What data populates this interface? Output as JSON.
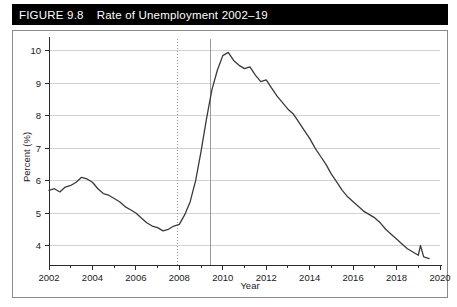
{
  "figure": {
    "number": "FIGURE 9.8",
    "title": "Rate of Unemployment 2002–19"
  },
  "chart_data": {
    "type": "line",
    "title": "Rate of Unemployment 2002–19",
    "xlabel": "Year",
    "ylabel": "Percent (%)",
    "xlim": [
      2002,
      2020
    ],
    "ylim": [
      3.4,
      10.3
    ],
    "grid": true,
    "legend": "none",
    "xticks": [
      2002,
      2004,
      2006,
      2008,
      2010,
      2012,
      2014,
      2016,
      2018,
      2020
    ],
    "xtick_labels": [
      "2002",
      "2004",
      "2006",
      "2008",
      "2010",
      "2012",
      "2014",
      "2016",
      "2018",
      "2020"
    ],
    "yticks": [
      4,
      5,
      6,
      7,
      8,
      9,
      10
    ],
    "ytick_labels": [
      "4",
      "5",
      "6",
      "7",
      "8",
      "9",
      "10"
    ],
    "annotations": [
      {
        "name": "recession-start-line",
        "type": "vline",
        "x": 2007.92,
        "style": "dotted",
        "color": "#9a9a9a"
      },
      {
        "name": "recession-end-line",
        "type": "vline",
        "x": 2009.42,
        "style": "solid",
        "color": "#9a9a9a"
      }
    ],
    "series": [
      {
        "name": "Unemployment rate",
        "color": "#3a3a3a",
        "x": [
          2002.0,
          2002.25,
          2002.5,
          2002.75,
          2003.0,
          2003.25,
          2003.5,
          2003.75,
          2004.0,
          2004.25,
          2004.5,
          2004.75,
          2005.0,
          2005.25,
          2005.5,
          2005.75,
          2006.0,
          2006.25,
          2006.5,
          2006.75,
          2007.0,
          2007.25,
          2007.5,
          2007.75,
          2008.0,
          2008.25,
          2008.5,
          2008.75,
          2009.0,
          2009.25,
          2009.5,
          2009.75,
          2010.0,
          2010.25,
          2010.5,
          2010.75,
          2011.0,
          2011.25,
          2011.5,
          2011.75,
          2012.0,
          2012.25,
          2012.5,
          2012.75,
          2013.0,
          2013.25,
          2013.5,
          2013.75,
          2014.0,
          2014.25,
          2014.5,
          2014.75,
          2015.0,
          2015.25,
          2015.5,
          2015.75,
          2016.0,
          2016.25,
          2016.5,
          2016.75,
          2017.0,
          2017.25,
          2017.5,
          2017.75,
          2018.0,
          2018.25,
          2018.5,
          2018.75,
          2019.0,
          2019.1,
          2019.25,
          2019.5
        ],
        "values": [
          5.7,
          5.75,
          5.65,
          5.8,
          5.85,
          5.95,
          6.1,
          6.05,
          5.95,
          5.75,
          5.6,
          5.55,
          5.45,
          5.35,
          5.2,
          5.1,
          5.0,
          4.85,
          4.7,
          4.6,
          4.55,
          4.45,
          4.5,
          4.6,
          4.65,
          4.95,
          5.35,
          6.0,
          6.9,
          7.9,
          8.8,
          9.4,
          9.85,
          9.95,
          9.7,
          9.55,
          9.45,
          9.5,
          9.25,
          9.05,
          9.1,
          8.85,
          8.6,
          8.4,
          8.2,
          8.05,
          7.8,
          7.55,
          7.3,
          7.0,
          6.75,
          6.5,
          6.2,
          5.95,
          5.7,
          5.5,
          5.35,
          5.2,
          5.05,
          4.95,
          4.85,
          4.7,
          4.5,
          4.35,
          4.2,
          4.05,
          3.9,
          3.8,
          3.7,
          4.0,
          3.65,
          3.6
        ]
      }
    ]
  }
}
